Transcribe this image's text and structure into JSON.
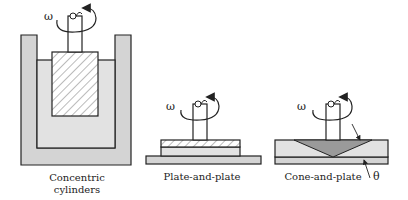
{
  "diagram": {
    "colors": {
      "outline": "#222222",
      "fluid_fill": "#dcdcdc",
      "cup_fill": "#d4d4d4",
      "cone_fill": "#9a9a9a",
      "background": "#ffffff"
    },
    "geometries": [
      {
        "id": "concentric-cylinders",
        "label_line1": "Concentric",
        "label_line2": "cylinders",
        "rotation_symbol": "ω"
      },
      {
        "id": "plate-and-plate",
        "label": "Plate-and-plate",
        "rotation_symbol": "ω"
      },
      {
        "id": "cone-and-plate",
        "label": "Cone-and-plate",
        "rotation_symbol": "ω",
        "angle_symbol": "θ"
      }
    ]
  }
}
